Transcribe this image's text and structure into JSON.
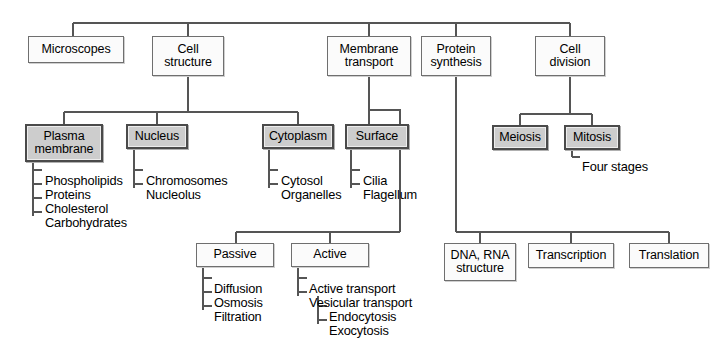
{
  "diagram": {
    "colors": {
      "shaded_fill": "#c9c9c9",
      "plain_fill": "#fbfbfb",
      "line": "#555555",
      "text": "#000000"
    },
    "nodes": [
      {
        "id": "microscopes",
        "label": "Microscopes",
        "style": "plain",
        "x": 28,
        "y": 36,
        "w": 96,
        "h": 27
      },
      {
        "id": "cell-structure",
        "label": "Cell\nstructure",
        "style": "plain",
        "x": 152,
        "y": 36,
        "w": 72,
        "h": 40
      },
      {
        "id": "membrane-transport",
        "label": "Membrane\ntransport",
        "style": "plain",
        "x": 327,
        "y": 36,
        "w": 84,
        "h": 40
      },
      {
        "id": "protein-synthesis",
        "label": "Protein\nsynthesis",
        "style": "plain",
        "x": 421,
        "y": 36,
        "w": 70,
        "h": 40
      },
      {
        "id": "cell-division",
        "label": "Cell\ndivision",
        "style": "plain",
        "x": 535,
        "y": 36,
        "w": 70,
        "h": 40
      },
      {
        "id": "plasma-membrane",
        "label": "Plasma\nmembrane",
        "style": "shaded",
        "x": 25,
        "y": 124,
        "w": 78,
        "h": 38
      },
      {
        "id": "nucleus",
        "label": "Nucleus",
        "style": "shaded",
        "x": 126,
        "y": 124,
        "w": 62,
        "h": 25
      },
      {
        "id": "cytoplasm",
        "label": "Cytoplasm",
        "style": "shaded",
        "x": 262,
        "y": 124,
        "w": 72,
        "h": 25
      },
      {
        "id": "surface",
        "label": "Surface",
        "style": "shaded",
        "x": 345,
        "y": 124,
        "w": 64,
        "h": 25
      },
      {
        "id": "meiosis",
        "label": "Meiosis",
        "style": "shaded",
        "x": 492,
        "y": 125,
        "w": 56,
        "h": 25
      },
      {
        "id": "mitosis",
        "label": "Mitosis",
        "style": "shaded",
        "x": 564,
        "y": 125,
        "w": 56,
        "h": 25
      },
      {
        "id": "passive",
        "label": "Passive",
        "style": "plain",
        "x": 196,
        "y": 243,
        "w": 78,
        "h": 24
      },
      {
        "id": "active",
        "label": "Active",
        "style": "plain",
        "x": 291,
        "y": 243,
        "w": 78,
        "h": 24
      },
      {
        "id": "dna-rna-structure",
        "label": "DNA, RNA\nstructure",
        "style": "plain",
        "x": 444,
        "y": 243,
        "w": 72,
        "h": 38
      },
      {
        "id": "transcription",
        "label": "Transcription",
        "style": "plain",
        "x": 528,
        "y": 243,
        "w": 86,
        "h": 25
      },
      {
        "id": "translation",
        "label": "Translation",
        "style": "plain",
        "x": 629,
        "y": 243,
        "w": 80,
        "h": 25
      }
    ],
    "leaves": [
      {
        "id": "phospholipids",
        "label": "Phospholipids",
        "x": 45,
        "y": 173
      },
      {
        "id": "proteins",
        "label": "Proteins",
        "x": 45,
        "y": 187
      },
      {
        "id": "cholesterol",
        "label": "Cholesterol",
        "x": 45,
        "y": 201
      },
      {
        "id": "carbohydrates",
        "label": "Carbohydrates",
        "x": 45,
        "y": 215
      },
      {
        "id": "chromosomes",
        "label": "Chromosomes",
        "x": 146,
        "y": 173
      },
      {
        "id": "nucleolus",
        "label": "Nucleolus",
        "x": 146,
        "y": 187
      },
      {
        "id": "cytosol",
        "label": "Cytosol",
        "x": 281,
        "y": 173
      },
      {
        "id": "organelles",
        "label": "Organelles",
        "x": 281,
        "y": 187
      },
      {
        "id": "cilia",
        "label": "Cilia",
        "x": 363,
        "y": 173
      },
      {
        "id": "flagellum",
        "label": "Flagellum",
        "x": 363,
        "y": 187
      },
      {
        "id": "four-stages",
        "label": "Four stages",
        "x": 582,
        "y": 159
      },
      {
        "id": "diffusion",
        "label": "Diffusion",
        "x": 214,
        "y": 281
      },
      {
        "id": "osmosis",
        "label": "Osmosis",
        "x": 214,
        "y": 295
      },
      {
        "id": "filtration",
        "label": "Filtration",
        "x": 214,
        "y": 309
      },
      {
        "id": "active-transport",
        "label": "Active transport",
        "x": 309,
        "y": 281
      },
      {
        "id": "vesicular-transport",
        "label": "Vesicular transport",
        "x": 309,
        "y": 295
      },
      {
        "id": "endocytosis",
        "label": "Endocytosis",
        "x": 329,
        "y": 309
      },
      {
        "id": "exocytosis",
        "label": "Exocytosis",
        "x": 329,
        "y": 323
      }
    ],
    "connectors": [
      {
        "id": "root-bus",
        "d": "M 73 23 L 570 23"
      },
      {
        "id": "root-to-microscopes",
        "d": "M 73 23 L 73 36"
      },
      {
        "id": "root-to-cell-structure",
        "d": "M 188 23 L 188 36"
      },
      {
        "id": "root-to-membrane",
        "d": "M 369 23 L 369 36"
      },
      {
        "id": "root-to-protein",
        "d": "M 456 23 L 456 36"
      },
      {
        "id": "root-to-cell-division",
        "d": "M 570 23 L 570 36"
      },
      {
        "id": "cell-structure-stem",
        "d": "M 188 76 L 188 112"
      },
      {
        "id": "cell-structure-bus",
        "d": "M 64 112 L 298 112"
      },
      {
        "id": "cs-to-plasma",
        "d": "M 64 112 L 64 124"
      },
      {
        "id": "cs-to-nucleus",
        "d": "M 157 112 L 157 124"
      },
      {
        "id": "cs-to-cytoplasm",
        "d": "M 298 112 L 298 124"
      },
      {
        "id": "plasma-spine",
        "d": "M 33 162 L 33 216"
      },
      {
        "id": "plasma-tick-1",
        "d": "M 33 170 L 42 170"
      },
      {
        "id": "plasma-tick-2",
        "d": "M 33 184 L 42 184"
      },
      {
        "id": "plasma-tick-3",
        "d": "M 33 198 L 42 198"
      },
      {
        "id": "plasma-tick-4",
        "d": "M 33 212 L 42 212"
      },
      {
        "id": "nucleus-spine",
        "d": "M 134 149 L 134 188"
      },
      {
        "id": "nucleus-tick-1",
        "d": "M 134 170 L 143 170"
      },
      {
        "id": "nucleus-tick-2",
        "d": "M 134 184 L 143 184"
      },
      {
        "id": "cytoplasm-spine",
        "d": "M 269 149 L 269 188"
      },
      {
        "id": "cytoplasm-tick-1",
        "d": "M 269 170 L 278 170"
      },
      {
        "id": "cytoplasm-tick-2",
        "d": "M 269 184 L 278 184"
      },
      {
        "id": "surface-spine",
        "d": "M 351 149 L 351 188"
      },
      {
        "id": "surface-tick-1",
        "d": "M 351 170 L 360 170"
      },
      {
        "id": "surface-tick-2",
        "d": "M 351 184 L 360 184"
      },
      {
        "id": "membrane-to-surface",
        "d": "M 369 76 L 369 110 L 400 110 L 400 124"
      },
      {
        "id": "membrane-surface-drop",
        "d": "M 369 110 L 369 124"
      },
      {
        "id": "membrane-long-drop",
        "d": "M 400 124 L 400 232"
      },
      {
        "id": "membrane-child-bus",
        "d": "M 236 232 L 400 232"
      },
      {
        "id": "mt-to-passive",
        "d": "M 236 232 L 236 243"
      },
      {
        "id": "mt-to-active",
        "d": "M 330 232 L 330 243"
      },
      {
        "id": "passive-spine",
        "d": "M 203 267 L 203 310"
      },
      {
        "id": "passive-tick-1",
        "d": "M 203 278 L 212 278"
      },
      {
        "id": "passive-tick-2",
        "d": "M 203 292 L 212 292"
      },
      {
        "id": "passive-tick-3",
        "d": "M 203 306 L 212 306"
      },
      {
        "id": "active-spine",
        "d": "M 298 267 L 298 296"
      },
      {
        "id": "active-tick-1",
        "d": "M 298 278 L 307 278"
      },
      {
        "id": "active-tick-2",
        "d": "M 298 292 L 307 292"
      },
      {
        "id": "vesicular-spine",
        "d": "M 318 296 L 318 324"
      },
      {
        "id": "vesicular-tick-1",
        "d": "M 318 306 L 327 306"
      },
      {
        "id": "vesicular-tick-2",
        "d": "M 318 320 L 327 320"
      },
      {
        "id": "cell-division-stem",
        "d": "M 570 76 L 570 114"
      },
      {
        "id": "cell-division-bus",
        "d": "M 520 114 L 592 114"
      },
      {
        "id": "cd-to-meiosis",
        "d": "M 520 114 L 520 125"
      },
      {
        "id": "cd-to-mitosis",
        "d": "M 592 114 L 592 125"
      },
      {
        "id": "mitosis-spine",
        "d": "M 572 150 L 572 157"
      },
      {
        "id": "mitosis-tick",
        "d": "M 572 157 L 580 157"
      },
      {
        "id": "protein-drop",
        "d": "M 456 76 L 456 232"
      },
      {
        "id": "protein-child-bus",
        "d": "M 456 232 L 669 232"
      },
      {
        "id": "ps-to-dna",
        "d": "M 480 232 L 480 243"
      },
      {
        "id": "ps-to-transcription",
        "d": "M 571 232 L 571 243"
      },
      {
        "id": "ps-to-translation",
        "d": "M 669 232 L 669 243"
      }
    ]
  }
}
